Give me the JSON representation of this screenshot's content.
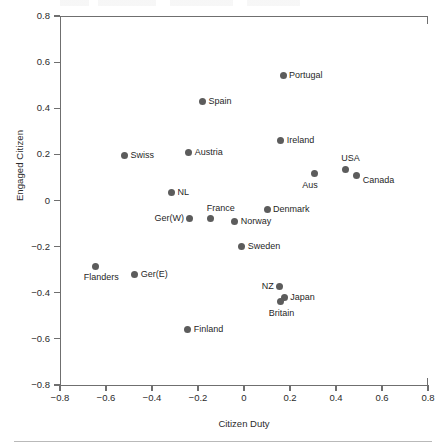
{
  "chart_data": {
    "type": "scatter",
    "title": "",
    "xlabel": "Citizen Duty",
    "ylabel": "Engaged Citizen",
    "xlim": [
      -0.8,
      0.8
    ],
    "ylim": [
      -0.8,
      0.8
    ],
    "xticks": [
      "-0.8",
      "-0.6",
      "-0.4",
      "-0.2",
      "0",
      "0.2",
      "0.4",
      "0.6",
      "0.8"
    ],
    "yticks": [
      "0.8",
      "0.6",
      "0.4",
      "0.2",
      "0",
      "-0.2",
      "-0.4",
      "-0.6",
      "-0.8"
    ],
    "grid": false,
    "legend": "none",
    "marker_color": "#5c5c5c",
    "axis_color": "#6f6f6f",
    "points": [
      {
        "label": "Portugal",
        "x": 0.17,
        "y": 0.54,
        "label_pos": "right"
      },
      {
        "label": "Spain",
        "x": -0.18,
        "y": 0.43,
        "label_pos": "right"
      },
      {
        "label": "Ireland",
        "x": 0.16,
        "y": 0.26,
        "label_pos": "right"
      },
      {
        "label": "Swiss",
        "x": -0.52,
        "y": 0.195,
        "label_pos": "right"
      },
      {
        "label": "Austria",
        "x": -0.24,
        "y": 0.21,
        "label_pos": "right"
      },
      {
        "label": "USA",
        "x": 0.44,
        "y": 0.135,
        "label_pos": "above"
      },
      {
        "label": "Aus",
        "x": 0.305,
        "y": 0.115,
        "label_pos": "below"
      },
      {
        "label": "Canada",
        "x": 0.49,
        "y": 0.11,
        "label_pos": "right-low"
      },
      {
        "label": "NL",
        "x": -0.315,
        "y": 0.035,
        "label_pos": "right"
      },
      {
        "label": "Denmark",
        "x": 0.1,
        "y": -0.04,
        "label_pos": "right"
      },
      {
        "label": "France",
        "x": -0.145,
        "y": -0.08,
        "label_pos": "above"
      },
      {
        "label": "Ger(W)",
        "x": -0.235,
        "y": -0.08,
        "label_pos": "left"
      },
      {
        "label": "Norway",
        "x": -0.04,
        "y": -0.09,
        "label_pos": "right"
      },
      {
        "label": "Sweden",
        "x": -0.01,
        "y": -0.2,
        "label_pos": "right"
      },
      {
        "label": "Flanders",
        "x": -0.645,
        "y": -0.285,
        "label_pos": "below"
      },
      {
        "label": "Ger(E)",
        "x": -0.475,
        "y": -0.32,
        "label_pos": "right"
      },
      {
        "label": "NZ",
        "x": 0.155,
        "y": -0.375,
        "label_pos": "left"
      },
      {
        "label": "Japan",
        "x": 0.175,
        "y": -0.42,
        "label_pos": "right"
      },
      {
        "label": "Britain",
        "x": 0.16,
        "y": -0.44,
        "label_pos": "below"
      },
      {
        "label": "Finland",
        "x": -0.245,
        "y": -0.56,
        "label_pos": "right"
      }
    ]
  }
}
